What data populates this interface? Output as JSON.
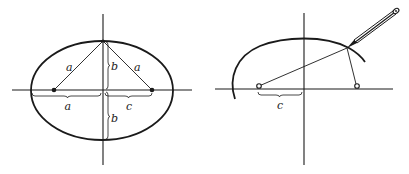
{
  "figure_left": {
    "title": "Ellipse with semi-axes a, b and focal distance c",
    "labels": {
      "left_segment": "a",
      "right_segment": "a",
      "upper_semi_minor": "b",
      "lower_semi_minor": "b",
      "semi_major_bracket": "a",
      "focal_bracket": "c"
    }
  },
  "figure_right": {
    "title": "Drawing an ellipse with pins, string and pencil",
    "labels": {
      "focal_bracket": "c"
    }
  }
}
